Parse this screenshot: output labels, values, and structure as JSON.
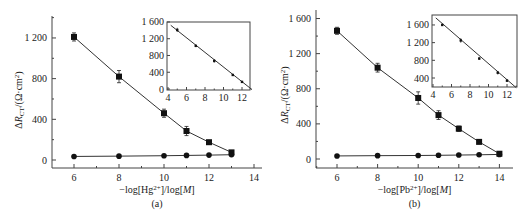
{
  "chart_data": [
    {
      "id": "a",
      "type": "line",
      "panel_label": "(a)",
      "xlabel_parts": [
        "−log[Hg",
        "2+",
        "]/log[",
        "M",
        "]"
      ],
      "ylabel": "ΔR_CT/(Ω·cm²)",
      "xlim": [
        5,
        14.4
      ],
      "ylim": [
        -80,
        1400
      ],
      "xticks": [
        6,
        8,
        10,
        12,
        14
      ],
      "yticks": [
        0,
        400,
        800,
        1200
      ],
      "ytick_labels": [
        "0",
        "400",
        "800",
        "1 200"
      ],
      "series": [
        {
          "name": "squares",
          "marker": "square",
          "x": [
            6,
            8,
            10,
            11,
            12,
            13
          ],
          "y": [
            1210,
            820,
            460,
            285,
            175,
            75
          ],
          "err": [
            40,
            60,
            40,
            45,
            15,
            15
          ]
        },
        {
          "name": "circles",
          "marker": "circle",
          "x": [
            6,
            8,
            10,
            11,
            12,
            13
          ],
          "y": [
            35,
            38,
            42,
            45,
            48,
            52
          ],
          "err": [
            0,
            0,
            0,
            0,
            0,
            0
          ]
        }
      ],
      "inset": {
        "type": "line",
        "xlim": [
          4,
          13
        ],
        "ylim": [
          0,
          1600
        ],
        "xticks": [
          4,
          6,
          8,
          10,
          12
        ],
        "yticks": [
          0,
          400,
          800,
          1200,
          1600
        ],
        "ytick_labels": [
          "0",
          "400",
          "800",
          "1 200",
          "1 600"
        ],
        "points": {
          "x": [
            5,
            7,
            9,
            11,
            12
          ],
          "y": [
            1410,
            1030,
            670,
            335,
            170
          ],
          "err": [
            50,
            30,
            40,
            15,
            15
          ]
        },
        "fit_line": {
          "x": [
            4.3,
            13
          ],
          "y": [
            1520,
            0
          ]
        }
      }
    },
    {
      "id": "b",
      "type": "line",
      "panel_label": "(b)",
      "xlabel_parts": [
        "−log[Pb",
        "2+",
        "]/log[",
        "M",
        "]"
      ],
      "ylabel": "ΔR_CT/(Ω·cm²)",
      "xlim": [
        5,
        15
      ],
      "ylim": [
        -100,
        1700
      ],
      "xticks": [
        6,
        8,
        10,
        12,
        14
      ],
      "yticks": [
        0,
        400,
        800,
        1200,
        1600
      ],
      "ytick_labels": [
        "0",
        "400",
        "800",
        "1 200",
        "1 600"
      ],
      "series": [
        {
          "name": "squares",
          "marker": "square",
          "x": [
            6,
            8,
            10,
            11,
            12,
            13,
            14
          ],
          "y": [
            1460,
            1040,
            695,
            500,
            345,
            195,
            60
          ],
          "err": [
            40,
            50,
            70,
            50,
            30,
            20,
            15
          ]
        },
        {
          "name": "circles",
          "marker": "circle",
          "x": [
            6,
            8,
            10,
            11,
            12,
            13,
            14
          ],
          "y": [
            35,
            38,
            40,
            42,
            45,
            48,
            52
          ],
          "err": [
            0,
            0,
            0,
            0,
            0,
            0,
            0
          ]
        }
      ],
      "inset": {
        "type": "line",
        "xlim": [
          4,
          13
        ],
        "ylim": [
          180,
          1800
        ],
        "xticks": [
          4,
          6,
          8,
          10,
          12
        ],
        "yticks": [
          400,
          800,
          1200,
          1600
        ],
        "ytick_labels": [
          "400",
          "800",
          "1 200",
          "1 600"
        ],
        "points": {
          "x": [
            5,
            7,
            9,
            11,
            12
          ],
          "y": [
            1600,
            1250,
            840,
            520,
            340
          ],
          "err": [
            20,
            50,
            30,
            40,
            30
          ]
        },
        "fit_line": {
          "x": [
            4.3,
            13
          ],
          "y": [
            1760,
            180
          ]
        }
      }
    }
  ],
  "layout": {
    "panels": [
      {
        "plot": {
          "left": 52,
          "top": 16,
          "right": 262,
          "bottom": 168,
          "x0": 74,
          "xu": 22.5,
          "y0": 160,
          "yu": 0.1017
        },
        "inset": {
          "left": 167,
          "top": 22,
          "right": 250,
          "bottom": 90,
          "x0": 168,
          "xu": 9.25,
          "y0": 89,
          "yu": 0.0419
        },
        "ylabel_x": 22,
        "ylabel_y": 100,
        "xlabel_y": 193,
        "panel_label_y": 207
      },
      {
        "plot": {
          "left": 316,
          "top": 10,
          "right": 513,
          "bottom": 168,
          "x0": 337,
          "xu": 20.3,
          "y0": 159,
          "yu": 0.0878
        },
        "inset": {
          "left": 432,
          "top": 15,
          "right": 517,
          "bottom": 87,
          "x0": 433,
          "xu": 9.25,
          "y0": 78,
          "yu": 0.0442,
          "ybase": 400
        },
        "ylabel_x": 288,
        "ylabel_y": 95,
        "xlabel_y": 193,
        "panel_label_y": 207
      }
    ]
  }
}
